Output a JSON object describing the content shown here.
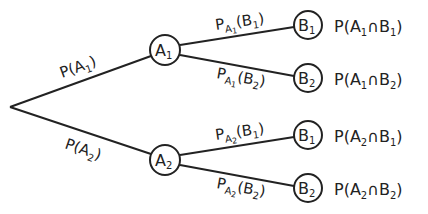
{
  "diagram": {
    "type": "probability-tree",
    "colors": {
      "stroke": "#222222",
      "background": "#ffffff"
    },
    "root": {
      "x": 10,
      "y": 107
    },
    "level1": [
      {
        "id": "A1",
        "main": "A",
        "sub": "1",
        "x": 165,
        "y": 50,
        "edge_label": {
          "prefix": "P(",
          "main": "A",
          "sub": "1",
          "suffix": ")"
        }
      },
      {
        "id": "A2",
        "main": "A",
        "sub": "2",
        "x": 165,
        "y": 160,
        "edge_label": {
          "prefix": "P(",
          "main": "A",
          "sub": "2",
          "suffix": ")"
        }
      }
    ],
    "level2": [
      {
        "id": "A1B1",
        "parent": "A1",
        "main": "B",
        "sub": "1",
        "x": 308,
        "y": 25,
        "edge_label": {
          "P": "P",
          "cond_main": "A",
          "cond_sub": "1",
          "arg_main": "B",
          "arg_sub": "1"
        },
        "result": {
          "prefix": "P(",
          "a_main": "A",
          "a_sub": "1",
          "op": "∩",
          "b_main": "B",
          "b_sub": "1",
          "suffix": ")"
        }
      },
      {
        "id": "A1B2",
        "parent": "A1",
        "main": "B",
        "sub": "2",
        "x": 308,
        "y": 78,
        "edge_label": {
          "P": "P",
          "cond_main": "A",
          "cond_sub": "1",
          "arg_main": "B",
          "arg_sub": "2"
        },
        "result": {
          "prefix": "P(",
          "a_main": "A",
          "a_sub": "1",
          "op": "∩",
          "b_main": "B",
          "b_sub": "2",
          "suffix": ")"
        }
      },
      {
        "id": "A2B1",
        "parent": "A2",
        "main": "B",
        "sub": "1",
        "x": 308,
        "y": 135,
        "edge_label": {
          "P": "P",
          "cond_main": "A",
          "cond_sub": "2",
          "arg_main": "B",
          "arg_sub": "1"
        },
        "result": {
          "prefix": "P(",
          "a_main": "A",
          "a_sub": "2",
          "op": "∩",
          "b_main": "B",
          "b_sub": "1",
          "suffix": ")"
        }
      },
      {
        "id": "A2B2",
        "parent": "A2",
        "main": "B",
        "sub": "2",
        "x": 308,
        "y": 188,
        "edge_label": {
          "P": "P",
          "cond_main": "A",
          "cond_sub": "2",
          "arg_main": "B",
          "arg_sub": "2"
        },
        "result": {
          "prefix": "P(",
          "a_main": "A",
          "a_sub": "2",
          "op": "∩",
          "b_main": "B",
          "b_sub": "2",
          "suffix": ")"
        }
      }
    ]
  }
}
